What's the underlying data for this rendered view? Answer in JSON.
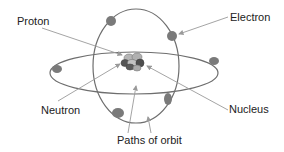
{
  "labels": {
    "proton": "Proton",
    "electron": "Electron",
    "neutron": "Neutron",
    "nucleus": "Nucleus",
    "orbit": "Paths of orbit"
  },
  "colors": {
    "orbit": "#6e6e6e",
    "electron": "#7a7a7a",
    "proton": "#b5b5b5",
    "neutron": "#555555",
    "arrow": "#9a9a9a",
    "text": "#222222"
  }
}
